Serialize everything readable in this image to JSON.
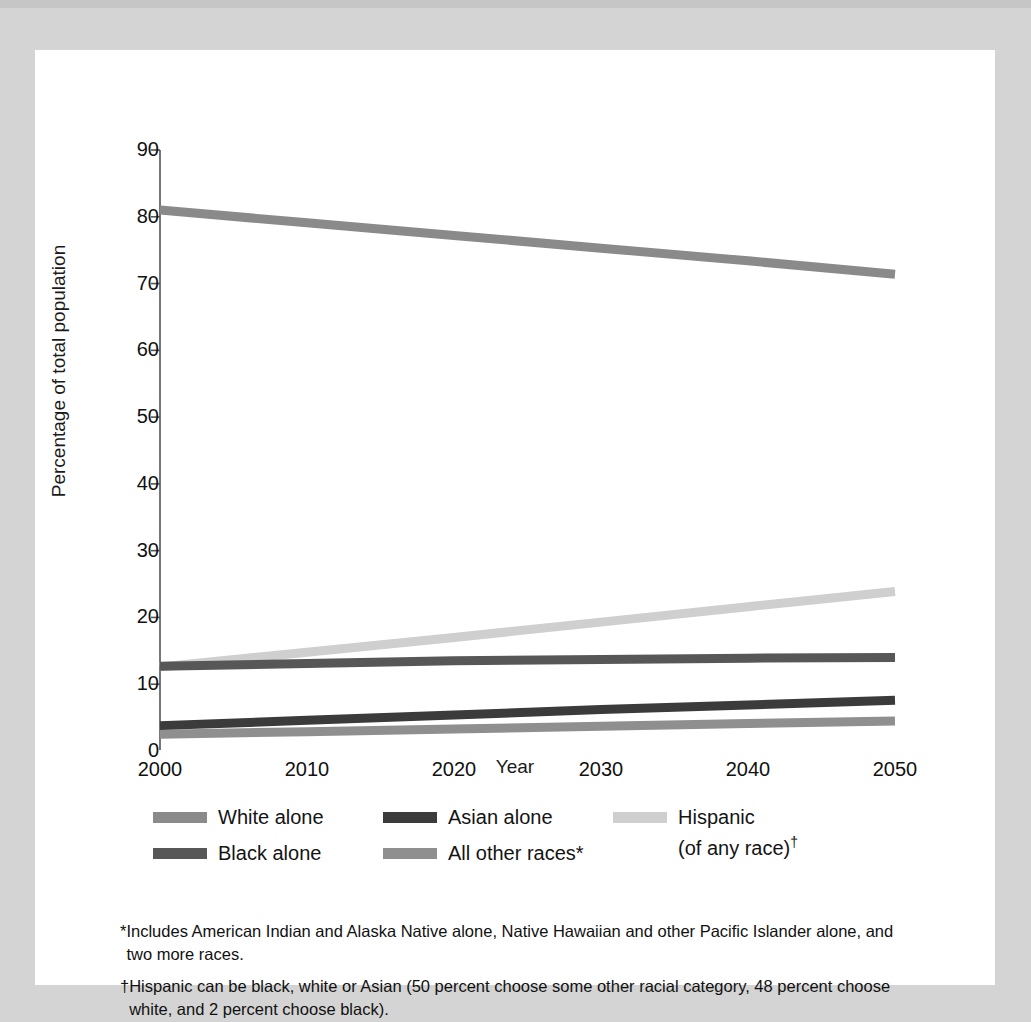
{
  "chart_data": {
    "type": "line",
    "title": "",
    "xlabel": "Year",
    "ylabel": "Percentage of total population",
    "x": [
      2000,
      2010,
      2020,
      2030,
      2040,
      2050
    ],
    "xlim": [
      2000,
      2050
    ],
    "ylim": [
      0,
      90
    ],
    "xticks": [
      "2000",
      "2010",
      "2020",
      "2030",
      "2040",
      "2050"
    ],
    "yticks": [
      "0",
      "10",
      "20",
      "30",
      "40",
      "50",
      "60",
      "70",
      "80",
      "90"
    ],
    "grid": false,
    "legend_position": "below-axes",
    "series": [
      {
        "name": "White alone",
        "color": "#8a8a8a",
        "values": [
          81.0,
          79.1,
          77.2,
          75.3,
          73.4,
          71.4
        ]
      },
      {
        "name": "Black alone",
        "color": "#575757",
        "values": [
          12.7,
          13.1,
          13.5,
          13.7,
          13.9,
          14.0
        ]
      },
      {
        "name": "Asian alone",
        "color": "#3b3b3b",
        "values": [
          3.8,
          4.6,
          5.4,
          6.2,
          6.9,
          7.6
        ]
      },
      {
        "name": "All other races*",
        "color": "#8f8f8f",
        "values": [
          2.5,
          2.9,
          3.3,
          3.7,
          4.1,
          4.5
        ]
      },
      {
        "name": "Hispanic (of any race)",
        "color": "#cfcfcf",
        "values": [
          12.6,
          14.8,
          17.0,
          19.3,
          21.6,
          23.9
        ]
      }
    ]
  },
  "axes": {
    "y_title": "Percentage of total population",
    "x_title": "Year",
    "y_ticks": [
      "90",
      "80",
      "70",
      "60",
      "50",
      "40",
      "30",
      "20",
      "10",
      "0"
    ],
    "x_ticks": [
      "2000",
      "2010",
      "2020",
      "2030",
      "2040",
      "2050"
    ]
  },
  "legend": {
    "items": [
      {
        "label": "White alone",
        "color": "#8a8a8a"
      },
      {
        "label": "Black alone",
        "color": "#575757"
      },
      {
        "label": "Asian alone",
        "color": "#3b3b3b"
      },
      {
        "label": "All other races*",
        "color": "#8f8f8f"
      },
      {
        "label": "Hispanic\n(of any race)",
        "color": "#cfcfcf",
        "dagger": "†"
      }
    ]
  },
  "footnotes": [
    {
      "mark": "*",
      "text": "Includes American Indian and Alaska Native alone, Native Hawaiian and other Pacific Islander alone, and two more races."
    },
    {
      "mark": "†",
      "text": "Hispanic can be black, white or Asian (50 percent choose some other racial category, 48 percent choose white, and 2 percent choose black)."
    }
  ]
}
